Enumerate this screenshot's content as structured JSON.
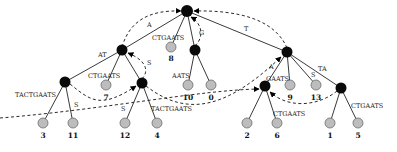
{
  "diagram": {
    "type": "suffix-tree",
    "root": {
      "id": "root",
      "x": 187,
      "y": 11
    },
    "internal_nodes": [
      {
        "id": "n_at",
        "x": 122,
        "y": 50
      },
      {
        "id": "n_g",
        "x": 195,
        "y": 50
      },
      {
        "id": "n_t",
        "x": 287,
        "y": 52
      },
      {
        "id": "n_tactgaats",
        "x": 65,
        "y": 82
      },
      {
        "id": "n_at2",
        "x": 142,
        "y": 83
      },
      {
        "id": "n_gaats",
        "x": 265,
        "y": 86
      },
      {
        "id": "n_ta",
        "x": 341,
        "y": 88
      }
    ],
    "leaves": [
      {
        "id": "leaf8",
        "label": "8",
        "x": 171,
        "y": 47
      },
      {
        "id": "leaf7",
        "label": "7",
        "x": 106,
        "y": 85
      },
      {
        "id": "leaf10",
        "label": "10",
        "x": 188,
        "y": 85
      },
      {
        "id": "leaf0",
        "label": "0",
        "x": 211,
        "y": 85
      },
      {
        "id": "leaf9",
        "label": "9",
        "x": 290,
        "y": 85
      },
      {
        "id": "leaf13",
        "label": "13",
        "x": 316,
        "y": 85
      },
      {
        "id": "leaf3",
        "label": "3",
        "x": 43,
        "y": 123
      },
      {
        "id": "leaf11",
        "label": "11",
        "x": 73,
        "y": 123
      },
      {
        "id": "leaf12",
        "label": "12",
        "x": 125,
        "y": 123
      },
      {
        "id": "leaf4",
        "label": "4",
        "x": 157,
        "y": 123
      },
      {
        "id": "leaf2",
        "label": "2",
        "x": 247,
        "y": 123
      },
      {
        "id": "leaf6",
        "label": "6",
        "x": 277,
        "y": 123
      },
      {
        "id": "leaf1",
        "label": "1",
        "x": 330,
        "y": 123
      },
      {
        "id": "leaf5",
        "label": "5",
        "x": 358,
        "y": 123
      }
    ],
    "edge_labels": [
      {
        "id": "lbl_at",
        "text": "AT",
        "x": 98,
        "y": 55
      },
      {
        "id": "lbl_ctgaats_8",
        "text": "CTGAATS",
        "x": 152,
        "y": 40
      },
      {
        "id": "lbl_t",
        "text": "T",
        "x": 245,
        "y": 31
      },
      {
        "id": "lbl_tactgaats_left",
        "text": "TACTGAATS",
        "x": 16,
        "y": 96
      },
      {
        "id": "lbl_s_11",
        "text": "S",
        "x": 74,
        "y": 107
      },
      {
        "id": "lbl_ctgaats_7",
        "text": "CTGAATS",
        "x": 88,
        "y": 78
      },
      {
        "id": "lbl_s_12",
        "text": "S",
        "x": 122,
        "y": 107
      },
      {
        "id": "lbl_tactgaats_4",
        "text": "TACTGAATS",
        "x": 150,
        "y": 110
      },
      {
        "id": "lbl_aats",
        "text": "AATS",
        "x": 172,
        "y": 78
      },
      {
        "id": "lbl_gaats",
        "text": "GAATS",
        "x": 265,
        "y": 80
      },
      {
        "id": "lbl_s_13",
        "text": "S",
        "x": 311,
        "y": 76
      },
      {
        "id": "lbl_ta",
        "text": "TA",
        "x": 317,
        "y": 71
      },
      {
        "id": "lbl_ctgaats_6",
        "text": "CTGAATS",
        "x": 272,
        "y": 116
      },
      {
        "id": "lbl_ctgaats_5",
        "text": "CTGAATS",
        "x": 350,
        "y": 107
      }
    ],
    "suffix_link_labels": [
      {
        "id": "sl_a",
        "text": "A",
        "x": 148,
        "y": 27
      },
      {
        "id": "sl_g",
        "text": "G",
        "x": 199,
        "y": 34
      },
      {
        "id": "sl_s",
        "text": "S",
        "x": 148,
        "y": 64
      },
      {
        "id": "sl_a2",
        "text": "A",
        "x": 270,
        "y": 68
      }
    ]
  }
}
